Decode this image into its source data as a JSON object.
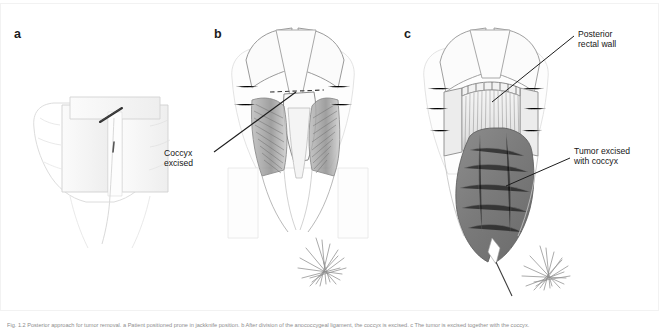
{
  "figure": {
    "panels": [
      {
        "id": "a",
        "label": "a"
      },
      {
        "id": "b",
        "label": "b"
      },
      {
        "id": "c",
        "label": "c"
      }
    ],
    "annotations": {
      "coccyx_excised": "Coccyx\nexcised",
      "posterior_rectal_wall": "Posterior\nrectal wall",
      "tumor_excised_with_coccyx": "Tumor excised\nwith coccyx"
    },
    "caption": "Fig. 1.2 Posterior approach for tumor removal. a Patient positioned prone in jackknife position. b After division of the anococcygeal ligament, the coccyx is excised. c The tumor is excised together with the coccyx.",
    "colors": {
      "tumor_fill": "#787878",
      "pencil_line": "#595959",
      "light_sketch": "#d7d7d7",
      "annotation_text": "#161616",
      "caption_text": "#8d8d8d"
    }
  }
}
